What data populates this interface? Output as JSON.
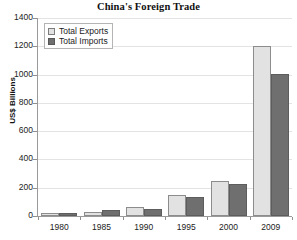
{
  "chart_data": {
    "type": "bar",
    "title": "China's Foreign Trade",
    "xlabel": "",
    "ylabel": "US$ Billions",
    "categories": [
      "1980",
      "1985",
      "1990",
      "1995",
      "2000",
      "2009"
    ],
    "series": [
      {
        "name": "Total Exports",
        "color": "#e2e2e2",
        "values": [
          18,
          27,
          62,
          149,
          249,
          1202
        ]
      },
      {
        "name": "Total Imports",
        "color": "#6f6f6f",
        "values": [
          20,
          42,
          53,
          132,
          225,
          1006
        ]
      }
    ],
    "ylim": [
      0,
      1400
    ],
    "yticks": [
      0,
      200,
      400,
      600,
      800,
      1000,
      1200,
      1400
    ],
    "ytick_labels": [
      "0",
      "200",
      "400",
      "600",
      "800",
      "1000",
      "1200",
      "1400"
    ],
    "grid": true,
    "legend_position": "top-left"
  },
  "legend": {
    "items": [
      {
        "label": "Total Exports",
        "swatch": "exports"
      },
      {
        "label": "Total Imports",
        "swatch": "imports"
      }
    ]
  },
  "colors": {
    "exports": "#e2e2e2",
    "imports": "#6f6f6f",
    "axis": "#9a9a9a",
    "grid": "#e3e3e3",
    "background": "#ffffff"
  }
}
